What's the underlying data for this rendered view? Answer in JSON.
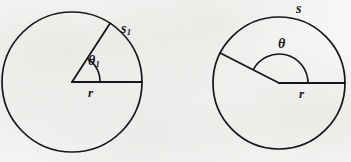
{
  "figure": {
    "background_color": "#f7f7f5",
    "ink_color": "#17171a"
  },
  "left_circle": {
    "name": "circle-with-acute-angle",
    "center": {
      "x": 72,
      "y": 82
    },
    "radius": 70,
    "radius_label": "r",
    "arc_label": "s",
    "arc_label_subscript": "1",
    "angle_label": "θ",
    "angle_label_subscript": "1",
    "angle_degrees": 57,
    "angle_arc_radius": 28
  },
  "right_circle": {
    "name": "circle-with-obtuse-angle",
    "center": {
      "x": 279,
      "y": 83
    },
    "radius": 66,
    "radius_label": "r",
    "arc_label": "s",
    "angle_label": "θ",
    "angle_degrees": 153,
    "angle_arc_radius": 29
  }
}
